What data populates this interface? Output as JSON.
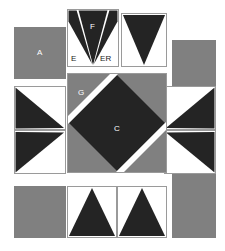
{
  "diagram": {
    "colors": {
      "background": "#ffffff",
      "gray": "#808080",
      "dark": "#242424",
      "white": "#ffffff",
      "outline": "#9a9a9a",
      "label_light": "#ffffff",
      "label_dark": "#1a1a1a"
    },
    "labels": {
      "a": "A",
      "c": "C",
      "e": "E",
      "er": "ER",
      "f": "F",
      "g": "G"
    },
    "pieces": [
      {
        "id": "corner-top-left-square",
        "label": "A",
        "shape": "square",
        "fill": "gray"
      },
      {
        "id": "top-center-flying-geese",
        "label": "F",
        "shape": "triangle-down-with-side-triangles",
        "fill": "dark"
      },
      {
        "id": "top-left-wing",
        "label": "E",
        "shape": "triangle",
        "fill": "dark"
      },
      {
        "id": "top-right-wing",
        "label": "ER",
        "shape": "triangle",
        "fill": "dark"
      },
      {
        "id": "top-right-triangle-square",
        "label": "",
        "shape": "triangle-down",
        "fill": "dark"
      },
      {
        "id": "corner-top-right-rect",
        "label": "",
        "shape": "rectangle",
        "fill": "gray"
      },
      {
        "id": "left-triangle-upper",
        "label": "",
        "shape": "triangle-right",
        "fill": "dark"
      },
      {
        "id": "left-triangle-lower",
        "label": "",
        "shape": "triangle-right",
        "fill": "dark"
      },
      {
        "id": "right-triangle-upper",
        "label": "",
        "shape": "triangle-left",
        "fill": "dark"
      },
      {
        "id": "right-triangle-lower",
        "label": "",
        "shape": "triangle-left",
        "fill": "dark"
      },
      {
        "id": "center-square-on-point",
        "label": "C",
        "shape": "diamond",
        "fill": "dark"
      },
      {
        "id": "center-background",
        "label": "G",
        "shape": "square",
        "fill": "gray"
      },
      {
        "id": "corner-bottom-left-square",
        "label": "",
        "shape": "square",
        "fill": "gray"
      },
      {
        "id": "bottom-triangle-left",
        "label": "",
        "shape": "triangle-up",
        "fill": "dark"
      },
      {
        "id": "bottom-triangle-right",
        "label": "",
        "shape": "triangle-up",
        "fill": "dark"
      },
      {
        "id": "corner-bottom-right-rect",
        "label": "",
        "shape": "rectangle",
        "fill": "gray"
      }
    ]
  }
}
